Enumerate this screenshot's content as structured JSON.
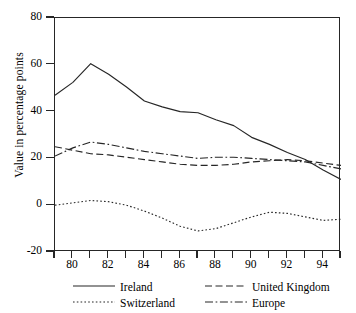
{
  "chart_data": {
    "type": "line",
    "title": "",
    "xlabel": "",
    "ylabel": "Value in percentage points",
    "xlim": [
      79,
      95
    ],
    "ylim": [
      -20,
      80
    ],
    "yticks": [
      80,
      60,
      40,
      20,
      0,
      -20
    ],
    "xticks": [
      79,
      80,
      81,
      82,
      83,
      84,
      85,
      86,
      87,
      88,
      89,
      90,
      91,
      92,
      93,
      94,
      95
    ],
    "xtick_labels": [
      "",
      "80",
      "",
      "82",
      "",
      "84",
      "",
      "86",
      "",
      "88",
      "",
      "90",
      "",
      "92",
      "",
      "94",
      ""
    ],
    "grid": false,
    "legend_position": "below",
    "x": [
      79,
      80,
      81,
      82,
      83,
      84,
      85,
      86,
      87,
      88,
      89,
      90,
      91,
      92,
      93,
      94,
      95
    ],
    "series": [
      {
        "name": "Ireland",
        "style": "solid",
        "color": "#262626",
        "values": [
          47.0,
          52.5,
          60.5,
          56.0,
          50.5,
          44.5,
          42.0,
          40.0,
          39.5,
          36.5,
          34.0,
          29.0,
          26.0,
          22.5,
          19.5,
          15.0,
          11.0
        ]
      },
      {
        "name": "United Kingdom",
        "style": "dashed",
        "color": "#262626",
        "values": [
          25.0,
          23.5,
          22.0,
          21.5,
          20.5,
          19.5,
          18.5,
          17.5,
          17.0,
          17.0,
          17.5,
          18.5,
          19.0,
          19.5,
          19.0,
          18.0,
          17.0
        ]
      },
      {
        "name": "Switzerland",
        "style": "dotted",
        "color": "#262626",
        "values": [
          0.0,
          1.0,
          2.0,
          1.5,
          0.0,
          -2.5,
          -5.5,
          -9.0,
          -11.0,
          -10.0,
          -7.5,
          -5.0,
          -3.0,
          -3.5,
          -5.0,
          -6.5,
          -6.0
        ]
      },
      {
        "name": "Europe",
        "style": "dashdot",
        "color": "#262626",
        "values": [
          21.0,
          24.5,
          27.0,
          26.0,
          24.5,
          23.0,
          22.0,
          21.0,
          20.0,
          20.5,
          20.5,
          20.0,
          19.5,
          19.0,
          18.5,
          17.0,
          15.5
        ]
      }
    ]
  },
  "legend": {
    "entries": [
      {
        "label": "Ireland"
      },
      {
        "label": "United Kingdom"
      },
      {
        "label": "Switzerland"
      },
      {
        "label": "Europe"
      }
    ]
  }
}
